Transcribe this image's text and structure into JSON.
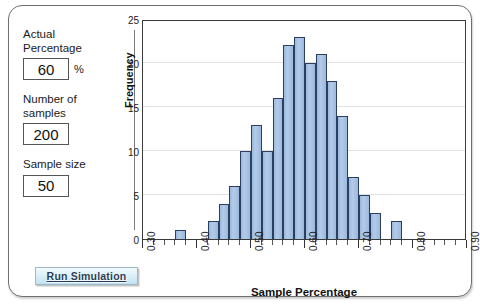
{
  "window": {
    "title": "Sampling Distribution Simulation"
  },
  "controls": {
    "actual_percentage": {
      "label": "Actual\nPercentage",
      "value": "60",
      "unit": "%"
    },
    "number_of_samples": {
      "label": "Number of\nsamples",
      "value": "200"
    },
    "sample_size": {
      "label": "Sample size",
      "value": "50"
    },
    "run_button_label": "Run Simulation"
  },
  "chart_data": {
    "type": "bar",
    "title": "",
    "xlabel": "Sample Percentage",
    "ylabel": "Frequency",
    "xlim": [
      0.3,
      0.9
    ],
    "ylim": [
      0,
      25
    ],
    "grid": true,
    "legend": "none",
    "bin_width": 0.02,
    "x_tick_labels": [
      "0.30",
      "0.40",
      "0.50",
      "0.60",
      "0.70",
      "0.80",
      "0.90"
    ],
    "x_tick_values": [
      0.3,
      0.4,
      0.5,
      0.6,
      0.7,
      0.8,
      0.9
    ],
    "x_minor_tick_step": 0.02,
    "y_tick_labels": [
      "0",
      "5",
      "10",
      "15",
      "20",
      "25"
    ],
    "y_tick_values": [
      0,
      5,
      10,
      15,
      20,
      25
    ],
    "bin_starts": [
      0.36,
      0.38,
      0.4,
      0.42,
      0.44,
      0.46,
      0.48,
      0.5,
      0.52,
      0.54,
      0.56,
      0.58,
      0.6,
      0.62,
      0.64,
      0.66,
      0.68,
      0.7,
      0.72,
      0.74,
      0.76
    ],
    "categories": [
      "0.36",
      "0.38",
      "0.40",
      "0.42",
      "0.44",
      "0.46",
      "0.48",
      "0.50",
      "0.52",
      "0.54",
      "0.56",
      "0.58",
      "0.60",
      "0.62",
      "0.64",
      "0.66",
      "0.68",
      "0.70",
      "0.72",
      "0.74",
      "0.76"
    ],
    "values": [
      1,
      0,
      0,
      2,
      4,
      6,
      10,
      13,
      10,
      16,
      22,
      23,
      20,
      21,
      18,
      14,
      7,
      5,
      3,
      0,
      2
    ],
    "bar_color": "#a8c3e3",
    "bar_edge_color": "#2c3f5e",
    "grid_color": "#e2e2e2"
  }
}
